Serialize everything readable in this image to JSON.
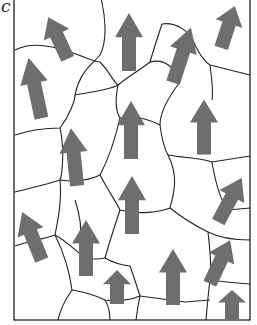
{
  "panel": {
    "label": "c",
    "frame": {
      "x": 14,
      "y": -2,
      "width": 236,
      "height": 322
    },
    "colors": {
      "boundary": "#222222",
      "arrow": "#6e6e6e",
      "background": "#ffffff"
    }
  },
  "grain_boundaries": [
    "M101,-2 C105,15 108,40 100,55 C95,62 80,70 75,95",
    "M15,50 C30,42 50,45 70,52 C85,57 95,62 100,62",
    "M75,95 C90,92 110,90 118,85",
    "M100,62 C110,72 112,80 118,85",
    "M118,85 C130,75 140,70 150,62 C165,58 175,68 180,82",
    "M150,62 C155,45 160,30 162,24 C175,22 190,30 195,45",
    "M195,45 C200,55 205,62 210,65 L250,75",
    "M210,65 C212,80 213,95 212,100",
    "M15,135 C30,130 45,128 60,128 C70,115 75,100 75,95",
    "M60,128 C65,150 62,175 60,180 C45,185 30,188 15,192",
    "M180,82 C170,95 160,110 160,125 C162,140 165,150 168,155",
    "M168,155 C185,158 200,158 212,162 L250,156",
    "M120,118 C135,115 150,120 160,125",
    "M118,85 C115,100 115,110 120,118 C115,140 108,160 100,175",
    "M60,180 C75,182 90,180 100,175",
    "M100,175 C108,190 115,200 120,210 C140,215 160,212 170,208",
    "M170,208 C175,190 178,175 168,155",
    "M212,162 C215,180 220,200 228,210 L250,208",
    "M170,208 C185,220 200,228 208,232 C210,250 212,265 210,280",
    "M60,180 C62,200 58,220 55,235 C40,240 25,242 15,246",
    "M55,235 C65,240 75,250 85,258",
    "M75,200 C80,215 82,228 80,240",
    "M120,210 C115,225 110,240 105,258 C112,262 120,265 130,266",
    "M85,258 C95,260 100,259 105,258",
    "M55,235 C65,255 70,275 72,290 C65,300 60,310 58,320",
    "M72,290 C85,292 95,295 105,300 C120,302 130,300 140,296",
    "M130,266 C135,280 138,290 140,296",
    "M140,296 C155,298 170,300 185,302 L210,300",
    "M208,232 C220,238 235,240 250,240",
    "M210,280 C222,282 235,283 250,284",
    "M210,280 C208,295 207,310 206,320",
    "M105,300 C108,305 110,312 110,320",
    "M140,296 C138,305 137,312 136,320"
  ],
  "arrows": [
    {
      "id": "arrow-1",
      "cx": 58,
      "cy": 38,
      "length": 46,
      "angle": -25
    },
    {
      "id": "arrow-2",
      "cx": 35,
      "cy": 88,
      "length": 62,
      "angle": -12
    },
    {
      "id": "arrow-3",
      "cx": 129,
      "cy": 42,
      "length": 58,
      "angle": 0
    },
    {
      "id": "arrow-4",
      "cx": 182,
      "cy": 55,
      "length": 58,
      "angle": 18
    },
    {
      "id": "arrow-5",
      "cx": 228,
      "cy": 27,
      "length": 44,
      "angle": 18
    },
    {
      "id": "arrow-6",
      "cx": 74,
      "cy": 157,
      "length": 58,
      "angle": -6
    },
    {
      "id": "arrow-7",
      "cx": 131,
      "cy": 130,
      "length": 58,
      "angle": 0
    },
    {
      "id": "arrow-8",
      "cx": 204,
      "cy": 127,
      "length": 55,
      "angle": 0
    },
    {
      "id": "arrow-9",
      "cx": 132,
      "cy": 205,
      "length": 58,
      "angle": 0
    },
    {
      "id": "arrow-10",
      "cx": 32,
      "cy": 236,
      "length": 52,
      "angle": -22
    },
    {
      "id": "arrow-11",
      "cx": 86,
      "cy": 248,
      "length": 56,
      "angle": 0
    },
    {
      "id": "arrow-12",
      "cx": 117,
      "cy": 287,
      "length": 34,
      "angle": 0
    },
    {
      "id": "arrow-13",
      "cx": 173,
      "cy": 277,
      "length": 56,
      "angle": 0
    },
    {
      "id": "arrow-14",
      "cx": 230,
      "cy": 200,
      "length": 50,
      "angle": 28
    },
    {
      "id": "arrow-15",
      "cx": 220,
      "cy": 262,
      "length": 48,
      "angle": 25
    },
    {
      "id": "arrow-16",
      "cx": 232,
      "cy": 305,
      "length": 30,
      "angle": 0
    }
  ]
}
